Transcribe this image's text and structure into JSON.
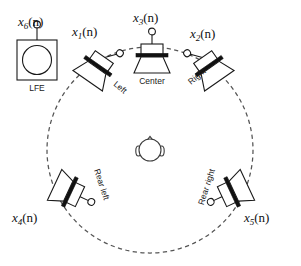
{
  "figure": {
    "background_color": "#ffffff",
    "line_color": "#1a1a1a",
    "ring_color": "#555555",
    "ring": {
      "center_x": 150,
      "center_y": 150,
      "radius": 103,
      "style": "dashed"
    },
    "listener": {
      "label": "listener-head",
      "x": 150,
      "y": 150,
      "radius": 11
    }
  },
  "speakers": [
    {
      "id": "lfe",
      "signal": "x",
      "subscript": "6",
      "signal_suffix": "(n)",
      "name": "LFE",
      "x": 37,
      "y": 62,
      "rotation": 0,
      "type": "subwoofer"
    },
    {
      "id": "left",
      "signal": "x",
      "subscript": "1",
      "signal_suffix": "(n)",
      "name": "Left",
      "x": 98,
      "y": 66,
      "rotation": 35,
      "type": "horn"
    },
    {
      "id": "center",
      "signal": "x",
      "subscript": "3",
      "signal_suffix": "(n)",
      "name": "Center",
      "x": 152,
      "y": 55,
      "rotation": 0,
      "type": "horn"
    },
    {
      "id": "right",
      "signal": "x",
      "subscript": "2",
      "signal_suffix": "(n)",
      "name": "Right",
      "x": 209,
      "y": 66,
      "rotation": -35,
      "type": "horn"
    },
    {
      "id": "rear-left",
      "signal": "x",
      "subscript": "4",
      "signal_suffix": "(n)",
      "name": "Rear left",
      "x": 70,
      "y": 192,
      "rotation": 115,
      "type": "horn"
    },
    {
      "id": "rear-right",
      "signal": "x",
      "subscript": "5",
      "signal_suffix": "(n)",
      "name": "Rear right",
      "x": 232,
      "y": 192,
      "rotation": -115,
      "type": "horn"
    }
  ],
  "labels": {
    "lfe_signal_x": 22,
    "lfe_signal_y": 24,
    "left_signal_x": 75,
    "left_signal_y": 34,
    "center_signal_x": 136,
    "center_signal_y": 20,
    "right_signal_x": 192,
    "right_signal_y": 36,
    "rear_left_signal_x": 14,
    "rear_left_signal_y": 218,
    "rear_right_signal_x": 246,
    "rear_right_signal_y": 218
  }
}
